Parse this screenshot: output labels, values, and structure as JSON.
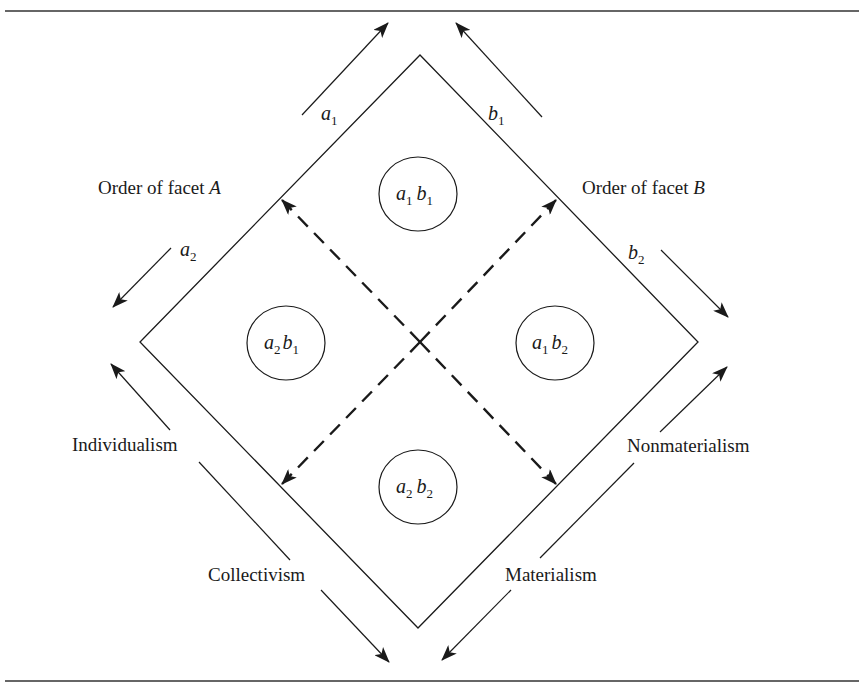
{
  "diagram": {
    "type": "facet-order-diamond",
    "colors": {
      "stroke": "#1a1a1a",
      "background": "#ffffff"
    },
    "facet_labels": {
      "facet_a": {
        "prefix": "Order of facet ",
        "letter": "A"
      },
      "facet_b": {
        "prefix": "Order of facet ",
        "letter": "B"
      }
    },
    "direction_labels": {
      "a1": {
        "base": "a",
        "sub": "1"
      },
      "a2": {
        "base": "a",
        "sub": "2"
      },
      "b1": {
        "base": "b",
        "sub": "1"
      },
      "b2": {
        "base": "b",
        "sub": "2"
      }
    },
    "axis_labels": {
      "individualism": "Individualism",
      "collectivism": "Collectivism",
      "nonmaterialism": "Nonmaterialism",
      "materialism": "Materialism"
    },
    "cells": [
      {
        "id": "a1b1",
        "a": "a",
        "a_sub": "1",
        "b": "b",
        "b_sub": "1",
        "position": "top"
      },
      {
        "id": "a2b1",
        "a": "a",
        "a_sub": "2",
        "b": "b",
        "b_sub": "1",
        "position": "left"
      },
      {
        "id": "a1b2",
        "a": "a",
        "a_sub": "1",
        "b": "b",
        "b_sub": "2",
        "position": "right"
      },
      {
        "id": "a2b2",
        "a": "a",
        "a_sub": "2",
        "b": "b",
        "b_sub": "2",
        "position": "bottom"
      }
    ]
  }
}
